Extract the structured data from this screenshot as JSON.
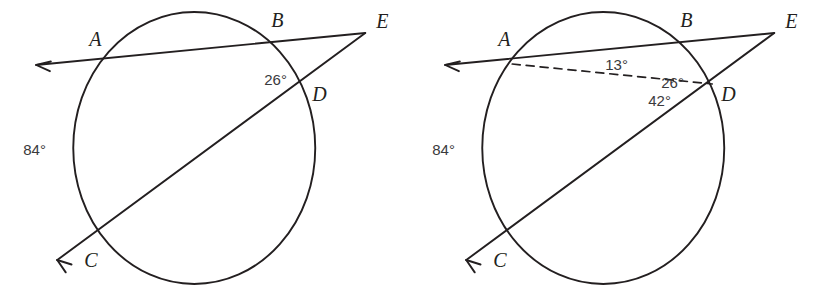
{
  "figure": {
    "background_color": "#ffffff",
    "ink_color": "#231f20",
    "angle_text_color": "#3a3a3c",
    "panels": [
      {
        "id": "left-diagram",
        "name": "circle-secants-given",
        "circle": {
          "cx": 194,
          "cy": 148,
          "rx": 121,
          "ry": 136
        },
        "points": [
          {
            "label": "A",
            "x": 101,
            "y": 63,
            "lx": 89,
            "ly": 46
          },
          {
            "label": "B",
            "x": 275,
            "y": 41,
            "lx": 271,
            "ly": 27
          },
          {
            "label": "C",
            "x": 93,
            "y": 250,
            "lx": 84,
            "ly": 267
          },
          {
            "label": "D",
            "x": 305,
            "y": 83,
            "lx": 312,
            "ly": 101
          },
          {
            "label": "E",
            "x": 365,
            "y": 33,
            "lx": 376,
            "ly": 28
          }
        ],
        "segments": [
          {
            "name": "secant-ray-abe",
            "x1": 365,
            "y1": 33,
            "x2": 36,
            "y2": 65,
            "style": "solid"
          },
          {
            "name": "secant-ray-cde",
            "x1": 365,
            "y1": 33,
            "x2": 57,
            "y2": 260,
            "style": "solid"
          }
        ],
        "arrows": [
          {
            "name": "arrow-toward-a",
            "x": 36,
            "y": 65,
            "angle": 174.5
          },
          {
            "name": "arrow-toward-c",
            "x": 57,
            "y": 260,
            "angle": 143.5
          }
        ],
        "angle_labels": [
          {
            "name": "arc-measure-84",
            "text": "84°",
            "x": 23,
            "y": 155,
            "anchor": "start"
          },
          {
            "name": "angle-measure-26",
            "text": "26°",
            "x": 264,
            "y": 85,
            "anchor": "start"
          }
        ],
        "dashed_chords": []
      },
      {
        "id": "right-diagram",
        "name": "circle-secants-solution",
        "circle": {
          "cx": 194,
          "cy": 148,
          "rx": 121,
          "ry": 136
        },
        "points": [
          {
            "label": "A",
            "x": 101,
            "y": 63,
            "lx": 89,
            "ly": 46
          },
          {
            "label": "B",
            "x": 275,
            "y": 41,
            "lx": 271,
            "ly": 27
          },
          {
            "label": "C",
            "x": 93,
            "y": 250,
            "lx": 84,
            "ly": 267
          },
          {
            "label": "D",
            "x": 305,
            "y": 83,
            "lx": 312,
            "ly": 101
          },
          {
            "label": "E",
            "x": 365,
            "y": 33,
            "lx": 376,
            "ly": 28
          }
        ],
        "segments": [
          {
            "name": "secant-ray-abe",
            "x1": 365,
            "y1": 33,
            "x2": 36,
            "y2": 65,
            "style": "solid"
          },
          {
            "name": "secant-ray-cde",
            "x1": 365,
            "y1": 33,
            "x2": 57,
            "y2": 260,
            "style": "solid"
          }
        ],
        "arrows": [
          {
            "name": "arrow-toward-a",
            "x": 36,
            "y": 65,
            "angle": 174.5
          },
          {
            "name": "arrow-toward-c",
            "x": 57,
            "y": 260,
            "angle": 143.5
          }
        ],
        "angle_labels": [
          {
            "name": "arc-measure-84",
            "text": "84°",
            "x": 23,
            "y": 155,
            "anchor": "start"
          },
          {
            "name": "inscribed-angle-13",
            "text": "13°",
            "x": 196,
            "y": 70,
            "anchor": "start"
          },
          {
            "name": "angle-measure-26",
            "text": "26°",
            "x": 252,
            "y": 88,
            "anchor": "start"
          },
          {
            "name": "exterior-angle-42",
            "text": "42°",
            "x": 239,
            "y": 106,
            "anchor": "start"
          }
        ],
        "dashed_chords": [
          {
            "name": "chord-ad",
            "x1": 103,
            "y1": 64,
            "x2": 303,
            "y2": 84
          }
        ]
      }
    ]
  }
}
